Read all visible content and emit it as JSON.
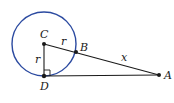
{
  "diagram": {
    "circle": {
      "center": "C",
      "radius_label": "r",
      "stroke": "#2b4aa0"
    },
    "points": [
      {
        "id": "C",
        "label": "C"
      },
      {
        "id": "B",
        "label": "B"
      },
      {
        "id": "D",
        "label": "D"
      },
      {
        "id": "A",
        "label": "A"
      }
    ],
    "segments": [
      {
        "from": "C",
        "to": "B",
        "label": "r"
      },
      {
        "from": "C",
        "to": "D",
        "label": "r"
      },
      {
        "from": "B",
        "to": "A",
        "label": "x"
      },
      {
        "from": "D",
        "to": "A",
        "label": ""
      }
    ],
    "right_angle_at": "D",
    "labels": {
      "C": "C",
      "B": "B",
      "D": "D",
      "A": "A",
      "r_cb": "r",
      "r_cd": "r",
      "x": "x"
    }
  }
}
